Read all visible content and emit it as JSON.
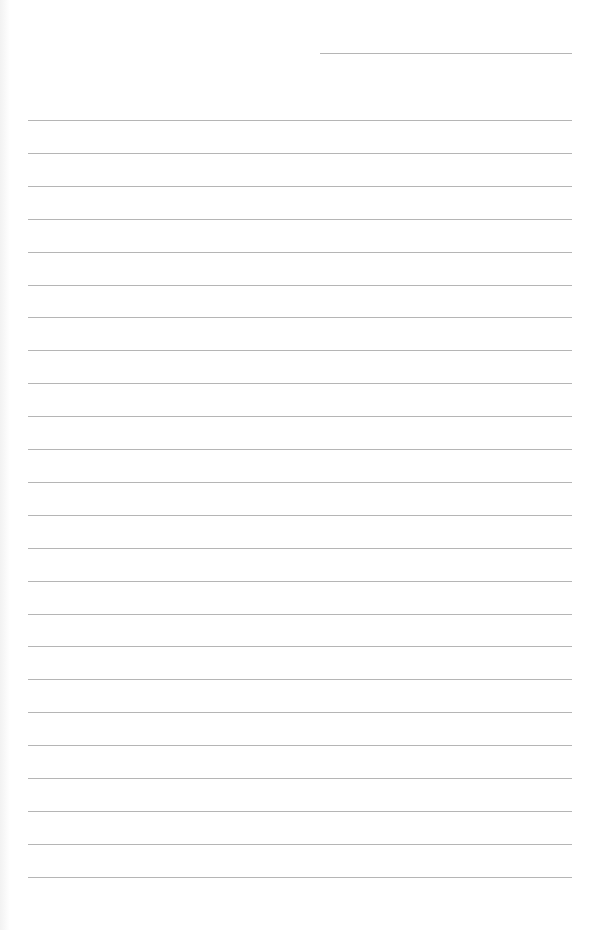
{
  "page": {
    "background": "#ffffff",
    "line_color": "#b5b5b5",
    "header_line": {
      "x_start": 320,
      "x_end": 572,
      "y": 53
    },
    "ruled_lines": {
      "count": 24,
      "x_start": 28,
      "x_end": 572,
      "first_y": 120,
      "spacing": 32.9
    }
  }
}
